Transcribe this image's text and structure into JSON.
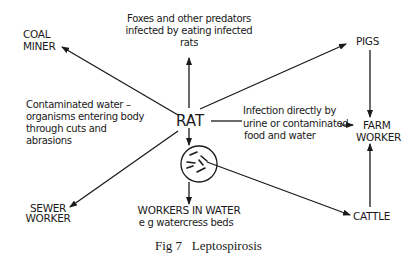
{
  "diagram": {
    "center": {
      "label": "RAT",
      "icon": "bacteria-circle-icon"
    },
    "nodes": {
      "coal_miner": [
        "COAL",
        "MINER"
      ],
      "predators": [
        "Foxes and other predators",
        "infected by eating infected",
        "rats"
      ],
      "pigs": "PIGS",
      "contaminated_water": [
        "Contaminated water –",
        "organisms entering body",
        "through cuts and",
        "abrasions"
      ],
      "infection_direct": [
        "Infection directly by",
        "urine or contaminated",
        "food and water"
      ],
      "farm_worker": [
        "FARM",
        "WORKER"
      ],
      "sewer_worker": [
        "SEWER",
        "WORKER"
      ],
      "workers_in_water": [
        "WORKERS IN WATER",
        "e g  watercress beds"
      ],
      "cattle": "CATTLE"
    },
    "edges": [
      {
        "from": "RAT",
        "to": "COAL MINER"
      },
      {
        "from": "RAT",
        "to": "Foxes and other predators"
      },
      {
        "from": "RAT",
        "to": "PIGS"
      },
      {
        "from": "RAT",
        "to": "FARM WORKER"
      },
      {
        "from": "RAT",
        "to": "SEWER WORKER"
      },
      {
        "from": "RAT",
        "to": "WORKERS IN WATER"
      },
      {
        "from": "RAT",
        "to": "CATTLE"
      },
      {
        "from": "PIGS",
        "to": "FARM WORKER"
      },
      {
        "from": "CATTLE",
        "to": "FARM WORKER"
      }
    ],
    "caption": "Fig 7   Leptospirosis"
  }
}
